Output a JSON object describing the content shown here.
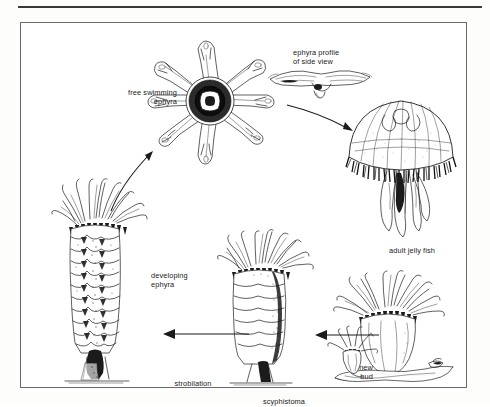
{
  "figure": {
    "background_color": "#ffffff",
    "ink_color": "#1b1b1b",
    "frame_color": "#6a6a6a"
  },
  "labels": {
    "free_swimming_ephyra": "free swimming\nephyra",
    "ephyra_profile": "ephyra profile\nof side view",
    "adult_jelly_fish": "adult jelly fish",
    "developing_ephyra": "developing\nephyra",
    "strobilation": "strobilation",
    "scyphistoma": "scyphistoma",
    "new_bud": "new\nbud"
  },
  "illustrations": [
    {
      "name": "free-swimming-ephyra",
      "description": "eight-armed star-shaped ephyra larva, top view, dark central disc"
    },
    {
      "name": "ephyra-side-profile",
      "description": "ephyra seen from the side, flattened saucer with manubrium below"
    },
    {
      "name": "adult-jelly-fish",
      "description": "adult medusa with domed bell, marginal tentacle fringe and four oral arms"
    },
    {
      "name": "strobila-developing-ephyra",
      "description": "strobila: stacked segmenting discs forming ephyrae on a stalked polyp"
    },
    {
      "name": "scyphistoma-polyp",
      "description": "scyphistoma polyp with crown of tentacles and segmented column"
    },
    {
      "name": "polyp-with-new-bud",
      "description": "polyp attached to substrate producing a small lateral bud"
    }
  ],
  "arrows": [
    {
      "name": "arrow-strobila-to-ephyra",
      "from": "developing ephyra",
      "to": "free swimming ephyra",
      "direction": "up-right, curved"
    },
    {
      "name": "arrow-ephyra-to-adult",
      "from": "ephyra profile",
      "to": "adult jelly fish",
      "direction": "down-right"
    },
    {
      "name": "arrow-scyphistoma-to-strobila",
      "from": "scyphistoma",
      "to": "strobilation",
      "direction": "left"
    },
    {
      "name": "arrow-bud-to-scyphistoma",
      "from": "new bud polyp",
      "to": "scyphistoma",
      "direction": "left"
    }
  ]
}
